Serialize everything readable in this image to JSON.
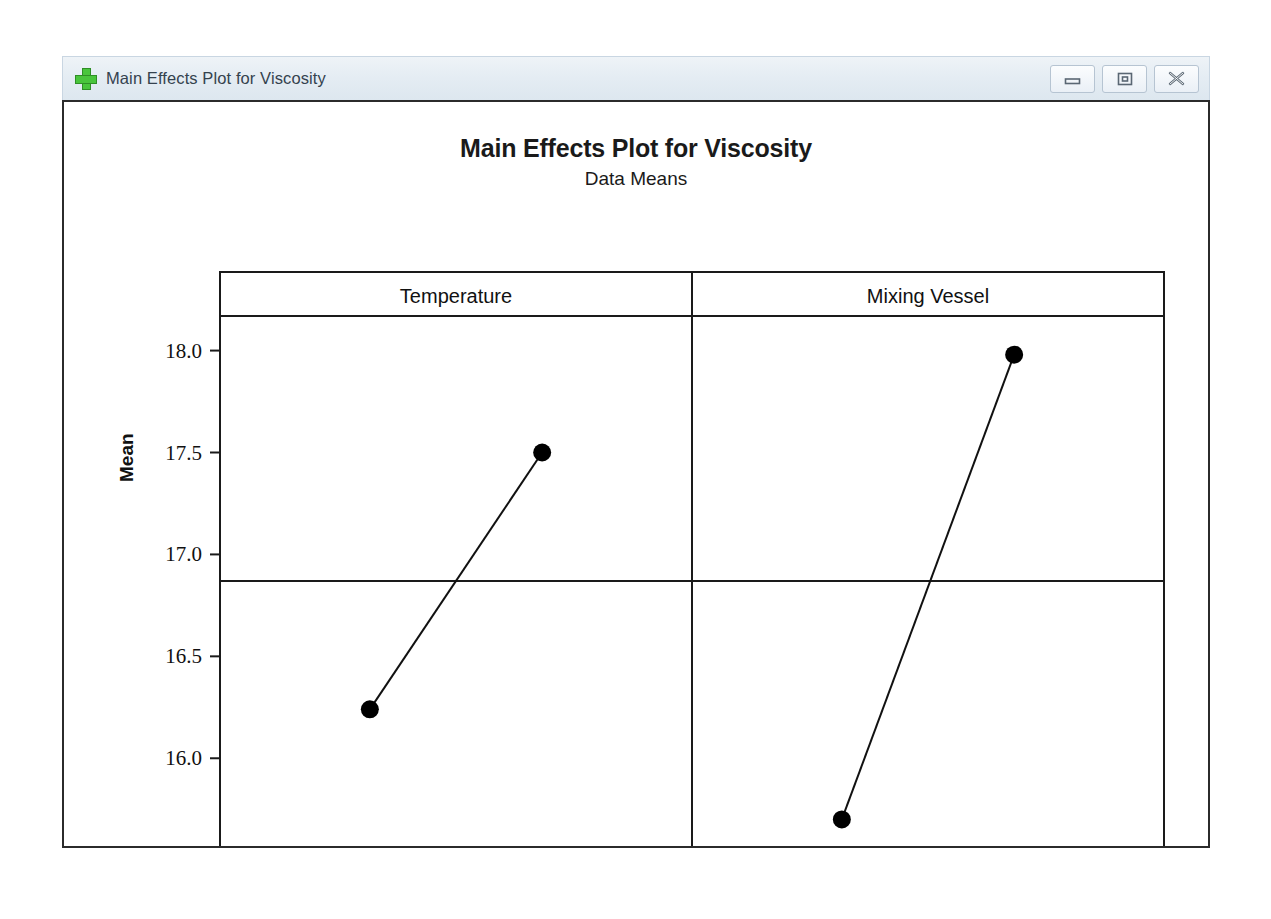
{
  "window": {
    "title": "Main Effects Plot for Viscosity",
    "icon": "minitab-graph-plus-icon",
    "controls": [
      {
        "name": "minimize-button",
        "label": "–",
        "glyph": "minimize"
      },
      {
        "name": "restore-button",
        "label": "□",
        "glyph": "restore"
      },
      {
        "name": "close-button",
        "label": "✕",
        "glyph": "close"
      }
    ]
  },
  "chart_data": {
    "type": "line",
    "title": "Main Effects Plot for Viscosity",
    "subtitle": "Data Means",
    "xlabel": "",
    "ylabel": "Mean",
    "ylim": [
      15.55,
      18.15
    ],
    "yticks": [
      16.0,
      16.5,
      17.0,
      17.5,
      18.0
    ],
    "ytick_labels": [
      "16.0",
      "16.5",
      "17.0",
      "17.5",
      "18.0"
    ],
    "grid": false,
    "legend": "none",
    "reference_line": 16.87,
    "panels": [
      {
        "name": "Temperature",
        "categories": [
          "-20",
          "20"
        ],
        "values": [
          16.24,
          17.5
        ]
      },
      {
        "name": "Mixing Vessel",
        "categories": [
          "1",
          "2"
        ],
        "values": [
          15.7,
          17.98
        ]
      }
    ],
    "marker": "filled-circle",
    "colors": {
      "line": "#111111",
      "marker": "#000000",
      "axis": "#1a1a1a",
      "background": "#ffffff"
    }
  }
}
